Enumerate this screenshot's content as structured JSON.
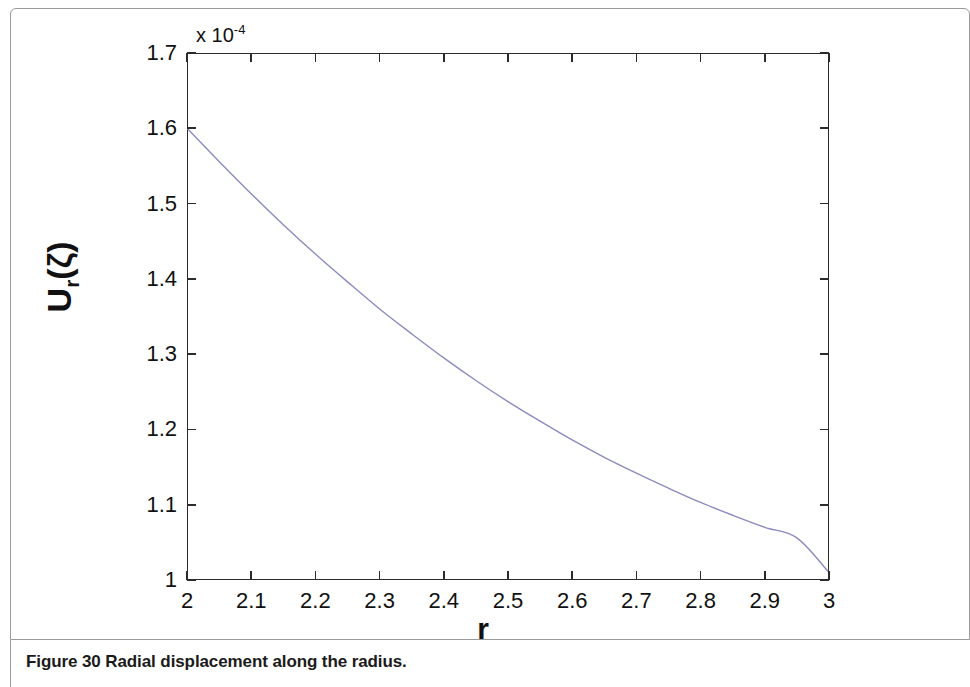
{
  "figure": {
    "caption": "Figure 30 Radial displacement along the radius."
  },
  "chart_data": {
    "type": "line",
    "title": "",
    "xlabel": "r",
    "ylabel": "U_r(ζ)",
    "ylabel_base": "U",
    "ylabel_sub": "r",
    "ylabel_arg": "(ζ)",
    "y_multiplier_text": "x 10",
    "y_multiplier_exponent": "-4",
    "y_multiplier_value": 0.0001,
    "xlim": [
      2,
      3
    ],
    "ylim": [
      1,
      1.7
    ],
    "xticks": [
      2,
      2.1,
      2.2,
      2.3,
      2.4,
      2.5,
      2.6,
      2.7,
      2.8,
      2.9,
      3
    ],
    "xtick_labels": [
      "2",
      "2.1",
      "2.2",
      "2.3",
      "2.4",
      "2.5",
      "2.6",
      "2.7",
      "2.8",
      "2.9",
      "3"
    ],
    "yticks": [
      1,
      1.1,
      1.2,
      1.3,
      1.4,
      1.5,
      1.6,
      1.7
    ],
    "ytick_labels": [
      "1",
      "1.1",
      "1.2",
      "1.3",
      "1.4",
      "1.5",
      "1.6",
      "1.7"
    ],
    "grid": false,
    "legend": false,
    "line_color": "#8b8bc0",
    "line_width": 1.4,
    "axis_color": "#2b2b2b",
    "background": "#ffffff",
    "series": [
      {
        "name": "Radial displacement",
        "x": [
          2.0,
          2.05,
          2.1,
          2.15,
          2.2,
          2.25,
          2.3,
          2.35,
          2.4,
          2.45,
          2.5,
          2.55,
          2.6,
          2.65,
          2.7,
          2.75,
          2.8,
          2.85,
          2.9,
          2.95,
          3.0
        ],
        "values": [
          1.6,
          1.556,
          1.513,
          1.472,
          1.433,
          1.396,
          1.36,
          1.327,
          1.295,
          1.265,
          1.237,
          1.211,
          1.186,
          1.163,
          1.142,
          1.122,
          1.103,
          1.086,
          1.07,
          1.056,
          1.01
        ]
      }
    ]
  }
}
